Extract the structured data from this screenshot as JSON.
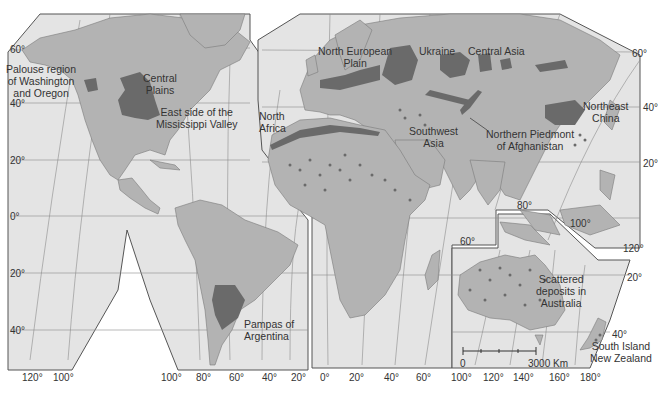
{
  "map": {
    "title": "World distribution of loess deposits",
    "colors": {
      "ocean": "#e4e4e4",
      "land": "#b3b3b3",
      "loess": "#6a6a6a",
      "grid": "#8c8c8c",
      "border": "#555555"
    },
    "regions": [
      {
        "id": "palouse",
        "label": "Palouse region of Washington and Oregon",
        "lines": [
          "Palouse region",
          "of Washington",
          "and Oregon"
        ]
      },
      {
        "id": "central-plains",
        "label": "Central Plains",
        "lines": [
          "Central",
          "Plains"
        ]
      },
      {
        "id": "mississippi",
        "label": "East side of the Mississippi Valley",
        "lines": [
          "East side of the",
          "Mississippi Valley"
        ]
      },
      {
        "id": "north-africa",
        "label": "North Africa",
        "lines": [
          "North",
          "Africa"
        ]
      },
      {
        "id": "north-european-plain",
        "label": "North European Plain",
        "lines": [
          "North European",
          "Plain"
        ]
      },
      {
        "id": "ukraine",
        "label": "Ukraine",
        "lines": [
          "Ukraine"
        ]
      },
      {
        "id": "central-asia",
        "label": "Central Asia",
        "lines": [
          "Central Asia"
        ]
      },
      {
        "id": "southwest-asia",
        "label": "Southwest Asia",
        "lines": [
          "Southwest",
          "Asia"
        ]
      },
      {
        "id": "afghanistan",
        "label": "Northern Piedmont of Afghanistan",
        "lines": [
          "Northern Piedmont",
          "of Afghanistan"
        ]
      },
      {
        "id": "northeast-china",
        "label": "Northeast China",
        "lines": [
          "Northeast",
          "China"
        ]
      },
      {
        "id": "pampas",
        "label": "Pampas of Argentina",
        "lines": [
          "Pampas of",
          "Argentina"
        ]
      },
      {
        "id": "australia",
        "label": "Scattered deposits in Australia",
        "lines": [
          "Scattered",
          "deposits in",
          "Australia"
        ]
      },
      {
        "id": "new-zealand",
        "label": "South Island New Zealand",
        "lines": [
          "South Island",
          "New Zealand"
        ]
      }
    ],
    "latitude_labels": {
      "left": [
        "60°",
        "40°",
        "20°",
        "0°",
        "20°",
        "40°"
      ],
      "right": [
        "60°",
        "40°",
        "20°",
        "20°",
        "40°"
      ]
    },
    "longitude_labels": {
      "bottom": [
        "120°",
        "100°",
        "100°",
        "80°",
        "60°",
        "40°",
        "20°",
        "0°",
        "20°",
        "40°",
        "60°",
        "100°",
        "120°",
        "140°",
        "160°",
        "180°"
      ],
      "interior": [
        "80°",
        "60°",
        "100°",
        "120°"
      ]
    },
    "scale_bar": {
      "start": "0",
      "end": "3000 Km"
    }
  }
}
